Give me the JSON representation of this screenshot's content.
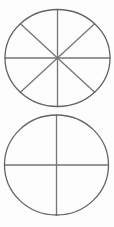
{
  "canvas": {
    "width": 114,
    "height": 227,
    "background": "#fdfdfd"
  },
  "style": {
    "outline_color": "#636363",
    "divider_color": "#757575",
    "stroke_width": 1.3
  },
  "diagram": {
    "shapes": [
      {
        "name": "top-circle",
        "cx": 57.5,
        "cy": 58,
        "rx": 52.5,
        "ry": 48.5,
        "parts": 8,
        "diameter_angles_deg": [
          0,
          45,
          90,
          135
        ]
      },
      {
        "name": "bottom-circle",
        "cx": 56.5,
        "cy": 165,
        "rx": 52,
        "ry": 50,
        "parts": 4,
        "diameter_angles_deg": [
          0,
          90
        ]
      }
    ]
  }
}
